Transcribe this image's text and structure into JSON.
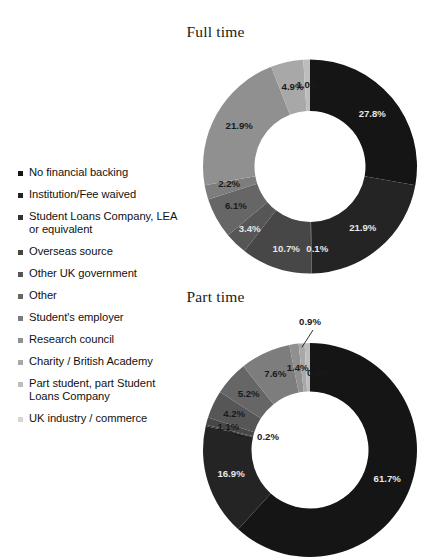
{
  "page": {
    "background": "#ffffff",
    "width": 431,
    "height": 560
  },
  "legend": {
    "name": "funding-source-legend",
    "items": [
      {
        "label": "No financial backing",
        "color": "#151515"
      },
      {
        "label": "Institution/Fee waived",
        "color": "#242424"
      },
      {
        "label": "Student Loans Company, LEA or equivalent",
        "color": "#333333"
      },
      {
        "label": "Overseas source",
        "color": "#474747"
      },
      {
        "label": "Other UK government",
        "color": "#565656"
      },
      {
        "label": "Other",
        "color": "#666666"
      },
      {
        "label": "Student's employer",
        "color": "#7d7d7d"
      },
      {
        "label": "Research council",
        "color": "#909090"
      },
      {
        "label": "Charity / British Academy",
        "color": "#a8a8a8"
      },
      {
        "label": "Part student, part Student Loans Company",
        "color": "#bdbdbd"
      },
      {
        "label": "UK industry / commerce",
        "color": "#d6d6d6"
      }
    ]
  },
  "chart_data": [
    {
      "type": "pie",
      "name": "full-time-donut",
      "title": "Full time",
      "hole": 0.52,
      "start_angle": 0,
      "direction": "clockwise",
      "categories": [
        "No financial backing",
        "Institution/Fee waived",
        "Student Loans Company, LEA or equivalent",
        "Overseas source",
        "Other UK government",
        "Other",
        "Student's employer",
        "Research council",
        "Charity / British Academy",
        "Part student, part Student Loans Company",
        "UK industry / commerce"
      ],
      "values": [
        27.8,
        21.9,
        0.1,
        10.7,
        3.4,
        6.1,
        2.2,
        21.9,
        4.9,
        1.0,
        0.0
      ],
      "labels": [
        "27.8%",
        "21.9%",
        "0.1%",
        "10.7%",
        "3.4%",
        "6.1%",
        "2.2%",
        "21.9%",
        "4.9%",
        "1.0%",
        ""
      ],
      "colors": [
        "#151515",
        "#242424",
        "#333333",
        "#474747",
        "#565656",
        "#666666",
        "#7d7d7d",
        "#909090",
        "#a8a8a8",
        "#bdbdbd",
        "#d6d6d6"
      ],
      "label_colors": [
        "#e8e8e8",
        "#e8e8e8",
        "#e8e8e8",
        "#e8e8e8",
        "#e8e8e8",
        "#1a1a1a",
        "#1a1a1a",
        "#1a1a1a",
        "#1a1a1a",
        "#1a1a1a",
        "#1a1a1a"
      ],
      "unit": "%",
      "legend_position": "left"
    },
    {
      "type": "pie",
      "name": "part-time-donut",
      "title": "Part time",
      "hole": 0.545,
      "start_angle": 0,
      "direction": "clockwise",
      "categories": [
        "No financial backing",
        "Institution/Fee waived",
        "Student Loans Company, LEA or equivalent",
        "Overseas source",
        "Other UK government",
        "Other",
        "Student's employer",
        "Research council",
        "Charity / British Academy",
        "Part student, part Student Loans Company",
        "UK industry / commerce"
      ],
      "values": [
        61.7,
        16.9,
        0.2,
        1.1,
        4.2,
        5.2,
        7.6,
        1.4,
        0.9,
        0.8,
        0.0
      ],
      "labels": [
        "61.7%",
        "16.9%",
        "0.2%",
        "1.1%",
        "4.2%",
        "5.2%",
        "7.6%",
        "1.4%",
        "0.9%",
        "0.8%",
        ""
      ],
      "colors": [
        "#151515",
        "#242424",
        "#333333",
        "#474747",
        "#565656",
        "#666666",
        "#7d7d7d",
        "#909090",
        "#a8a8a8",
        "#bdbdbd",
        "#d6d6d6"
      ],
      "label_colors": [
        "#e8e8e8",
        "#e8e8e8",
        "#1a1a1a",
        "#1a1a1a",
        "#1a1a1a",
        "#1a1a1a",
        "#1a1a1a",
        "#1a1a1a",
        "#1a1a1a",
        "#1a1a1a",
        "#1a1a1a"
      ],
      "unit": "%",
      "legend_position": "left"
    }
  ],
  "geometry": {
    "full_time": {
      "cx": 310,
      "cy": 166.5,
      "r_outer": 107,
      "r_inner": 55.5,
      "title_y": 32
    },
    "part_time": {
      "cx": 310,
      "cy": 450.0,
      "r_outer": 107,
      "r_inner": 58.5,
      "title_y": 297
    }
  }
}
